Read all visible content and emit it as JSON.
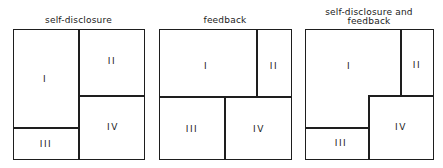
{
  "panels": [
    {
      "title": "self-disclosure",
      "quadrants": {
        "q1": "I",
        "q2": "II",
        "q3": "III",
        "q4": "IV"
      }
    },
    {
      "title": "feedback",
      "quadrants": {
        "q1": "I",
        "q2": "II",
        "q3": "III",
        "q4": "IV"
      }
    },
    {
      "title_line1": "self-disclosure and",
      "title_line2": "feedback",
      "quadrants": {
        "q1": "I",
        "q2": "II",
        "q3": "III",
        "q4": "IV"
      }
    }
  ]
}
